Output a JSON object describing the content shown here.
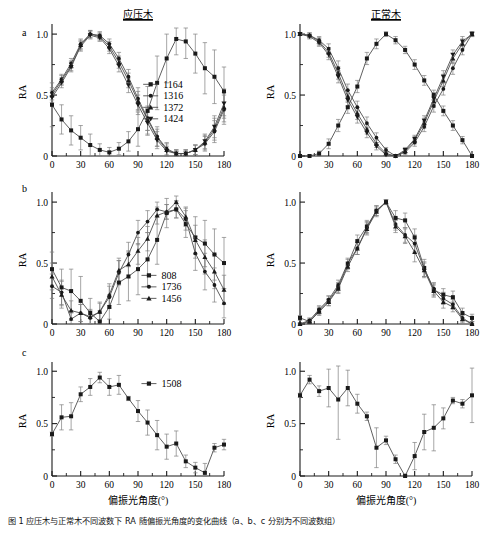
{
  "figure": {
    "width": 494,
    "height": 535,
    "caption": "图 1    应压木与正常木不同波数下 RA 随偏振光角度的变化曲线（a、b、c 分别为不同波数组）"
  },
  "columns": [
    {
      "key": "compression",
      "title": "应压木"
    },
    {
      "key": "normal",
      "title": "正常木"
    }
  ],
  "axes": {
    "ylabel": "RA",
    "xlabel": "偏振光角度(°)",
    "yticks": [
      "0",
      "0.5",
      "1.0"
    ],
    "xticks": [
      "0",
      "30",
      "60",
      "90",
      "120",
      "150",
      "180"
    ],
    "xlim": [
      0,
      180
    ],
    "ylim": [
      0,
      1.05
    ],
    "ymajor": [
      0,
      0.5,
      1.0
    ]
  },
  "panel_labels": [
    "a",
    "b",
    "c"
  ],
  "markers": {
    "square": "■",
    "circle": "●",
    "triangle": "▲",
    "inverted-triangle": "▼"
  },
  "colors": {
    "line": "#4d4d4d",
    "marker": "#1a1a1a",
    "axis": "#1a1a1a",
    "error": "#808080",
    "background": "#ffffff"
  },
  "chart_data": [
    {
      "id": "panel-a-compression",
      "type": "line",
      "panel": "a",
      "title": "应压木",
      "xlabel": "",
      "ylabel": "RA",
      "xlim": [
        0,
        180
      ],
      "ylim": [
        0,
        1.05
      ],
      "grid": false,
      "legend_position": "center-right",
      "x": [
        0,
        10,
        20,
        30,
        40,
        50,
        60,
        70,
        80,
        90,
        100,
        110,
        120,
        130,
        140,
        150,
        160,
        170,
        180
      ],
      "series": [
        {
          "name": "1164",
          "marker": "square",
          "values": [
            0.42,
            0.3,
            0.21,
            0.15,
            0.09,
            0.05,
            0.03,
            0.06,
            0.12,
            0.22,
            0.37,
            0.6,
            0.8,
            0.96,
            0.94,
            0.84,
            0.72,
            0.65,
            0.53
          ],
          "errors": [
            0.18,
            0.12,
            0.12,
            0.1,
            0.09,
            0.05,
            0.04,
            0.05,
            0.08,
            0.14,
            0.2,
            0.22,
            0.2,
            0.13,
            0.14,
            0.16,
            0.21,
            0.22,
            0.2
          ]
        },
        {
          "name": "1316",
          "marker": "circle",
          "values": [
            0.52,
            0.63,
            0.76,
            0.92,
            1.0,
            0.99,
            0.92,
            0.8,
            0.65,
            0.47,
            0.31,
            0.16,
            0.06,
            0.02,
            0.02,
            0.05,
            0.1,
            0.2,
            0.38
          ],
          "errors": [
            0.04,
            0.04,
            0.04,
            0.04,
            0.03,
            0.03,
            0.04,
            0.05,
            0.06,
            0.09,
            0.1,
            0.08,
            0.05,
            0.03,
            0.03,
            0.04,
            0.06,
            0.09,
            0.12
          ]
        },
        {
          "name": "1372",
          "marker": "triangle",
          "values": [
            0.5,
            0.62,
            0.74,
            0.91,
            1.0,
            0.98,
            0.9,
            0.77,
            0.62,
            0.45,
            0.3,
            0.15,
            0.05,
            0.02,
            0.02,
            0.05,
            0.11,
            0.22,
            0.4
          ],
          "errors": [
            0.04,
            0.04,
            0.04,
            0.04,
            0.03,
            0.03,
            0.04,
            0.05,
            0.06,
            0.08,
            0.09,
            0.07,
            0.05,
            0.03,
            0.03,
            0.04,
            0.06,
            0.09,
            0.12
          ]
        },
        {
          "name": "1424",
          "marker": "inverted-triangle",
          "values": [
            0.48,
            0.6,
            0.73,
            0.9,
            0.99,
            0.97,
            0.88,
            0.74,
            0.58,
            0.42,
            0.27,
            0.13,
            0.04,
            0.02,
            0.02,
            0.05,
            0.12,
            0.24,
            0.43
          ],
          "errors": [
            0.04,
            0.04,
            0.04,
            0.04,
            0.03,
            0.03,
            0.04,
            0.05,
            0.06,
            0.08,
            0.09,
            0.07,
            0.04,
            0.03,
            0.03,
            0.04,
            0.06,
            0.09,
            0.12
          ]
        }
      ]
    },
    {
      "id": "panel-a-normal",
      "type": "line",
      "panel": "a",
      "title": "正常木",
      "xlabel": "",
      "ylabel": "RA",
      "xlim": [
        0,
        180
      ],
      "ylim": [
        0,
        1.05
      ],
      "grid": false,
      "legend_position": "none",
      "x": [
        0,
        10,
        20,
        30,
        40,
        50,
        60,
        70,
        80,
        90,
        100,
        110,
        120,
        130,
        140,
        150,
        160,
        170,
        180
      ],
      "series": [
        {
          "name": "1164",
          "marker": "square",
          "values": [
            0.0,
            0.0,
            0.02,
            0.1,
            0.25,
            0.4,
            0.57,
            0.8,
            0.92,
            1.0,
            0.95,
            0.87,
            0.75,
            0.62,
            0.5,
            0.37,
            0.25,
            0.13,
            0.0
          ],
          "errors": [
            0.01,
            0.01,
            0.02,
            0.04,
            0.05,
            0.05,
            0.05,
            0.05,
            0.04,
            0.02,
            0.03,
            0.03,
            0.04,
            0.04,
            0.04,
            0.04,
            0.04,
            0.03,
            0.01
          ]
        },
        {
          "name": "1316",
          "marker": "circle",
          "values": [
            1.0,
            0.99,
            0.95,
            0.88,
            0.72,
            0.54,
            0.4,
            0.27,
            0.15,
            0.05,
            0.0,
            0.03,
            0.11,
            0.24,
            0.41,
            0.55,
            0.72,
            0.87,
            1.0
          ],
          "errors": [
            0.01,
            0.02,
            0.03,
            0.04,
            0.06,
            0.05,
            0.05,
            0.05,
            0.04,
            0.02,
            0.01,
            0.02,
            0.03,
            0.04,
            0.05,
            0.05,
            0.05,
            0.04,
            0.02
          ]
        },
        {
          "name": "1372",
          "marker": "triangle",
          "values": [
            1.0,
            0.99,
            0.94,
            0.85,
            0.68,
            0.49,
            0.35,
            0.22,
            0.1,
            0.02,
            0.0,
            0.04,
            0.13,
            0.27,
            0.45,
            0.62,
            0.8,
            0.92,
            1.0
          ],
          "errors": [
            0.01,
            0.02,
            0.03,
            0.04,
            0.05,
            0.05,
            0.05,
            0.04,
            0.03,
            0.02,
            0.01,
            0.02,
            0.03,
            0.04,
            0.05,
            0.05,
            0.04,
            0.04,
            0.02
          ]
        },
        {
          "name": "1424",
          "marker": "inverted-triangle",
          "values": [
            1.0,
            0.98,
            0.93,
            0.83,
            0.65,
            0.46,
            0.32,
            0.19,
            0.08,
            0.01,
            0.0,
            0.05,
            0.14,
            0.29,
            0.47,
            0.65,
            0.83,
            0.94,
            1.0
          ],
          "errors": [
            0.01,
            0.02,
            0.03,
            0.04,
            0.05,
            0.05,
            0.05,
            0.04,
            0.03,
            0.02,
            0.01,
            0.02,
            0.03,
            0.04,
            0.05,
            0.05,
            0.04,
            0.04,
            0.02
          ]
        }
      ]
    },
    {
      "id": "panel-b-compression",
      "type": "line",
      "panel": "b",
      "title": "",
      "xlabel": "",
      "ylabel": "RA",
      "xlim": [
        0,
        180
      ],
      "ylim": [
        0,
        1.05
      ],
      "grid": false,
      "legend_position": "center-right",
      "x": [
        0,
        10,
        20,
        30,
        40,
        50,
        60,
        70,
        80,
        90,
        100,
        110,
        120,
        130,
        140,
        150,
        160,
        170,
        180
      ],
      "series": [
        {
          "name": "808",
          "marker": "square",
          "values": [
            0.45,
            0.3,
            0.27,
            0.19,
            0.09,
            0.02,
            0.14,
            0.34,
            0.39,
            0.45,
            0.53,
            0.69,
            0.91,
            0.94,
            0.82,
            0.71,
            0.66,
            0.57,
            0.5
          ],
          "errors": [
            0.14,
            0.15,
            0.18,
            0.2,
            0.12,
            0.09,
            0.1,
            0.18,
            0.2,
            0.21,
            0.22,
            0.2,
            0.12,
            0.07,
            0.11,
            0.17,
            0.19,
            0.21,
            0.21
          ]
        },
        {
          "name": "1736",
          "marker": "circle",
          "values": [
            0.31,
            0.26,
            0.04,
            0.09,
            0.05,
            0.1,
            0.22,
            0.42,
            0.57,
            0.75,
            0.84,
            0.94,
            0.92,
            0.94,
            0.86,
            0.58,
            0.43,
            0.32,
            0.17
          ],
          "errors": [
            0.1,
            0.1,
            0.07,
            0.07,
            0.06,
            0.07,
            0.09,
            0.1,
            0.1,
            0.1,
            0.09,
            0.06,
            0.06,
            0.07,
            0.09,
            0.14,
            0.15,
            0.14,
            0.12
          ]
        },
        {
          "name": "1456",
          "marker": "triangle",
          "values": [
            0.39,
            0.24,
            0.11,
            0.09,
            0.06,
            0.1,
            0.24,
            0.44,
            0.49,
            0.6,
            0.7,
            0.89,
            0.92,
            1.0,
            0.88,
            0.69,
            0.55,
            0.43,
            0.28
          ],
          "errors": [
            0.11,
            0.11,
            0.08,
            0.07,
            0.06,
            0.08,
            0.09,
            0.1,
            0.11,
            0.11,
            0.1,
            0.07,
            0.06,
            0.05,
            0.08,
            0.12,
            0.14,
            0.14,
            0.12
          ]
        }
      ]
    },
    {
      "id": "panel-b-normal",
      "type": "line",
      "panel": "b",
      "title": "",
      "xlabel": "",
      "ylabel": "RA",
      "xlim": [
        0,
        180
      ],
      "ylim": [
        0,
        1.05
      ],
      "grid": false,
      "legend_position": "none",
      "x": [
        0,
        10,
        20,
        30,
        40,
        50,
        60,
        70,
        80,
        90,
        100,
        110,
        120,
        130,
        140,
        150,
        160,
        170,
        180
      ],
      "series": [
        {
          "name": "808",
          "marker": "square",
          "values": [
            0.05,
            0.02,
            0.11,
            0.19,
            0.3,
            0.49,
            0.68,
            0.8,
            0.93,
            1.0,
            0.87,
            0.85,
            0.71,
            0.46,
            0.28,
            0.24,
            0.22,
            0.09,
            0.05
          ],
          "errors": [
            0.02,
            0.02,
            0.03,
            0.04,
            0.04,
            0.04,
            0.05,
            0.05,
            0.04,
            0.02,
            0.06,
            0.06,
            0.07,
            0.07,
            0.05,
            0.05,
            0.05,
            0.04,
            0.03
          ]
        },
        {
          "name": "1736",
          "marker": "circle",
          "values": [
            0.0,
            0.03,
            0.12,
            0.2,
            0.32,
            0.5,
            0.62,
            0.79,
            0.93,
            1.0,
            0.82,
            0.73,
            0.66,
            0.45,
            0.29,
            0.21,
            0.16,
            0.05,
            0.0
          ],
          "errors": [
            0.01,
            0.02,
            0.03,
            0.03,
            0.04,
            0.04,
            0.05,
            0.05,
            0.04,
            0.02,
            0.05,
            0.06,
            0.07,
            0.06,
            0.05,
            0.05,
            0.04,
            0.03,
            0.02
          ]
        },
        {
          "name": "1456",
          "marker": "triangle",
          "values": [
            0.0,
            0.02,
            0.1,
            0.18,
            0.29,
            0.47,
            0.62,
            0.78,
            0.92,
            1.0,
            0.8,
            0.72,
            0.59,
            0.44,
            0.27,
            0.18,
            0.14,
            0.04,
            0.0
          ],
          "errors": [
            0.01,
            0.02,
            0.03,
            0.03,
            0.04,
            0.04,
            0.05,
            0.05,
            0.04,
            0.02,
            0.05,
            0.06,
            0.08,
            0.06,
            0.05,
            0.05,
            0.04,
            0.03,
            0.02
          ]
        }
      ]
    },
    {
      "id": "panel-c-compression",
      "type": "line",
      "panel": "c",
      "title": "",
      "xlabel": "偏振光角度(°)",
      "ylabel": "RA",
      "xlim": [
        0,
        180
      ],
      "ylim": [
        0,
        1.05
      ],
      "grid": false,
      "legend_position": "center-right",
      "x": [
        0,
        10,
        20,
        30,
        40,
        50,
        60,
        70,
        80,
        90,
        100,
        110,
        120,
        130,
        140,
        150,
        160,
        170,
        180
      ],
      "series": [
        {
          "name": "1508",
          "marker": "square",
          "values": [
            0.4,
            0.56,
            0.57,
            0.78,
            0.85,
            0.94,
            0.85,
            0.87,
            0.74,
            0.62,
            0.51,
            0.39,
            0.28,
            0.31,
            0.14,
            0.08,
            0.03,
            0.27,
            0.3
          ],
          "errors": [
            0.02,
            0.12,
            0.13,
            0.07,
            0.08,
            0.05,
            0.08,
            0.09,
            0.02,
            0.1,
            0.12,
            0.14,
            0.12,
            0.12,
            0.06,
            0.05,
            0.09,
            0.04,
            0.05
          ]
        }
      ]
    },
    {
      "id": "panel-c-normal",
      "type": "line",
      "panel": "c",
      "title": "",
      "xlabel": "偏振光角度(°)",
      "ylabel": "RA",
      "xlim": [
        0,
        180
      ],
      "ylim": [
        0,
        1.05
      ],
      "grid": false,
      "legend_position": "none",
      "x": [
        0,
        10,
        20,
        30,
        40,
        50,
        60,
        70,
        80,
        90,
        100,
        110,
        120,
        130,
        140,
        150,
        160,
        170,
        180
      ],
      "series": [
        {
          "name": "1508",
          "marker": "square",
          "values": [
            0.77,
            0.92,
            0.81,
            0.84,
            0.73,
            0.84,
            0.69,
            0.57,
            0.27,
            0.34,
            0.16,
            0.0,
            0.19,
            0.42,
            0.46,
            0.55,
            0.72,
            0.69,
            0.77
          ],
          "errors": [
            0.02,
            0.04,
            0.05,
            0.18,
            0.38,
            0.17,
            0.09,
            0.04,
            0.19,
            0.04,
            0.04,
            0.02,
            0.13,
            0.17,
            0.22,
            0.1,
            0.03,
            0.04,
            0.26
          ]
        }
      ]
    }
  ]
}
